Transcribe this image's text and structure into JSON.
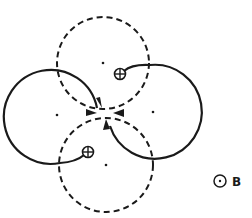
{
  "diagram": {
    "legend": {
      "symbol": "dot-in-circle",
      "meaning": "magnetic field out of page",
      "label": "B"
    },
    "particles": [
      {
        "symbol": "⊕",
        "charge": "positive",
        "location": "upper-right"
      },
      {
        "symbol": "⊕",
        "charge": "positive",
        "location": "lower-left"
      }
    ],
    "paths": [
      {
        "name": "top",
        "style": "dashed"
      },
      {
        "name": "bottom",
        "style": "dashed"
      },
      {
        "name": "left",
        "style": "solid"
      },
      {
        "name": "right",
        "style": "solid"
      }
    ],
    "colors": {
      "ink": "#1a1a1a",
      "background": "#ffffff"
    }
  }
}
